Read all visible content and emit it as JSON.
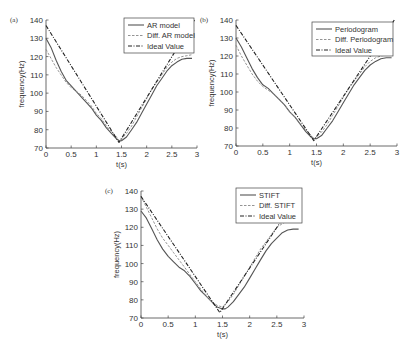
{
  "chart_data": [
    {
      "type": "line",
      "panel_label": "(a)",
      "title": "",
      "xlabel": "t(s)",
      "ylabel": "frequency(Hz)",
      "xlim": [
        0,
        3
      ],
      "ylim": [
        70,
        140
      ],
      "xticks": [
        0,
        0.5,
        1,
        1.5,
        2,
        2.5,
        3
      ],
      "xtick_labels": [
        "0",
        "0.5",
        "1",
        "1.5",
        "2",
        "2.5",
        "3"
      ],
      "yticks": [
        70,
        80,
        90,
        100,
        110,
        120,
        130,
        140
      ],
      "ytick_labels": [
        "70",
        "80",
        "90",
        "100",
        "110",
        "120",
        "130",
        "140"
      ],
      "grid": false,
      "legend_position": "upper right",
      "frame": {
        "x0": 46,
        "x1": 197,
        "y_bottom": 148,
        "y_top": 20
      },
      "legend_box": {
        "x": 124,
        "y": 18,
        "w": 70,
        "h": 35
      },
      "series": [
        {
          "name": "AR model",
          "style": "solid",
          "x": [
            0,
            0.1,
            0.2,
            0.3,
            0.4,
            0.5,
            0.6,
            0.7,
            0.8,
            0.9,
            1.0,
            1.1,
            1.2,
            1.3,
            1.4,
            1.45,
            1.5,
            1.6,
            1.7,
            1.8,
            1.9,
            2.0,
            2.1,
            2.2,
            2.3,
            2.4,
            2.5,
            2.6,
            2.7,
            2.8,
            2.9
          ],
          "y": [
            130,
            125,
            118,
            112,
            107,
            104,
            101,
            98,
            95,
            92,
            88,
            85,
            81,
            78,
            75,
            74,
            74,
            76,
            80,
            84,
            89,
            94,
            99,
            104,
            108,
            112,
            115,
            117,
            118.5,
            119,
            119
          ]
        },
        {
          "name": "Diff. AR model",
          "style": "dashed",
          "x": [
            0,
            0.1,
            0.2,
            0.3,
            0.4,
            0.5,
            0.6,
            0.7,
            0.8,
            0.9,
            1.0,
            1.1,
            1.2,
            1.3,
            1.4,
            1.45,
            1.5,
            1.6,
            1.7,
            1.8,
            1.9,
            2.0,
            2.1,
            2.2,
            2.3,
            2.4,
            2.5,
            2.6,
            2.7,
            2.8,
            2.9
          ],
          "y": [
            124,
            119,
            114,
            110,
            106,
            103,
            101,
            99,
            96,
            93,
            89,
            86,
            82,
            79,
            76,
            74,
            75,
            78,
            82,
            87,
            92,
            97,
            102,
            106,
            110,
            114,
            117,
            119,
            120,
            120.5,
            121
          ]
        },
        {
          "name": "Ideal Value",
          "style": "dashdot",
          "x": [
            0,
            1.45,
            2.95
          ],
          "y": [
            137,
            73,
            140
          ]
        }
      ]
    },
    {
      "type": "line",
      "panel_label": "(b)",
      "title": "",
      "xlabel": "t(s)",
      "ylabel": "frequency(Hz)",
      "xlim": [
        0,
        3
      ],
      "ylim": [
        70,
        140
      ],
      "xticks": [
        0,
        0.5,
        1,
        1.5,
        2,
        2.5,
        3
      ],
      "xtick_labels": [
        "0",
        "0.5",
        "1",
        "1.5",
        "2",
        "2.5",
        "3"
      ],
      "yticks": [
        70,
        80,
        90,
        100,
        110,
        120,
        130,
        140
      ],
      "ytick_labels": [
        "70",
        "80",
        "90",
        "100",
        "110",
        "120",
        "130",
        "140"
      ],
      "grid": false,
      "legend_position": "upper right",
      "frame": {
        "x0": 236,
        "x1": 397,
        "y_bottom": 146,
        "y_top": 20
      },
      "legend_box": {
        "x": 312,
        "y": 22,
        "w": 81,
        "h": 34
      },
      "series": [
        {
          "name": "Periodogram",
          "style": "solid",
          "x": [
            0,
            0.1,
            0.2,
            0.3,
            0.4,
            0.5,
            0.6,
            0.7,
            0.8,
            0.9,
            1.0,
            1.1,
            1.2,
            1.3,
            1.4,
            1.45,
            1.5,
            1.6,
            1.7,
            1.8,
            1.9,
            2.0,
            2.1,
            2.2,
            2.3,
            2.4,
            2.5,
            2.6,
            2.7,
            2.8,
            2.9
          ],
          "y": [
            130,
            125,
            119,
            113,
            108,
            104,
            102,
            99,
            96,
            93,
            89,
            86,
            82,
            78,
            75,
            74,
            74,
            76,
            80,
            84,
            89,
            94,
            99,
            104,
            108,
            112,
            115,
            117,
            118.5,
            119,
            119
          ]
        },
        {
          "name": "Diff. Periodogram",
          "style": "dashed",
          "x": [
            0,
            0.1,
            0.2,
            0.3,
            0.4,
            0.5,
            0.6,
            0.7,
            0.8,
            0.9,
            1.0,
            1.1,
            1.2,
            1.3,
            1.4,
            1.45,
            1.5,
            1.6,
            1.7,
            1.8,
            1.9,
            2.0,
            2.1,
            2.2,
            2.3,
            2.4,
            2.5,
            2.6,
            2.7,
            2.8,
            2.9
          ],
          "y": [
            126,
            120,
            115,
            110,
            106,
            103,
            101,
            99,
            96,
            93,
            89,
            86,
            82,
            79,
            76,
            74,
            75,
            78,
            82,
            87,
            92,
            97,
            102,
            106,
            110,
            114,
            117,
            119,
            120,
            120.5,
            121
          ]
        },
        {
          "name": "Ideal Value",
          "style": "dashdot",
          "x": [
            0,
            1.45,
            2.95
          ],
          "y": [
            137,
            73,
            140
          ]
        }
      ]
    },
    {
      "type": "line",
      "panel_label": "(c)",
      "title": "",
      "xlabel": "t(s)",
      "ylabel": "frequency(Hz)",
      "xlim": [
        0,
        3
      ],
      "ylim": [
        70,
        140
      ],
      "xticks": [
        0,
        0.5,
        1,
        1.5,
        2,
        2.5,
        3
      ],
      "xtick_labels": [
        "0",
        "0.5",
        "1",
        "1.5",
        "2",
        "2.5",
        "3"
      ],
      "yticks": [
        70,
        80,
        90,
        100,
        110,
        120,
        130,
        140
      ],
      "ytick_labels": [
        "70",
        "80",
        "90",
        "100",
        "110",
        "120",
        "130",
        "140"
      ],
      "grid": false,
      "legend_position": "upper right",
      "frame": {
        "x0": 141,
        "x1": 304,
        "y_bottom": 318,
        "y_top": 191
      },
      "legend_box": {
        "x": 236,
        "y": 188,
        "w": 66,
        "h": 35
      },
      "series": [
        {
          "name": "STIFT",
          "style": "solid",
          "x": [
            0,
            0.1,
            0.2,
            0.3,
            0.4,
            0.5,
            0.6,
            0.7,
            0.8,
            0.9,
            1.0,
            1.1,
            1.2,
            1.3,
            1.4,
            1.5,
            1.55,
            1.6,
            1.7,
            1.8,
            1.9,
            2.0,
            2.1,
            2.2,
            2.3,
            2.4,
            2.5,
            2.6,
            2.7,
            2.8,
            2.9
          ],
          "y": [
            129,
            125,
            119,
            113,
            108,
            104,
            101,
            98,
            96,
            93,
            89,
            85,
            82,
            79,
            76,
            75,
            75,
            76,
            79,
            83,
            87,
            92,
            97,
            102,
            107,
            111,
            114,
            117,
            118.5,
            119,
            119
          ]
        },
        {
          "name": "Diff. STIFT",
          "style": "dashed",
          "x": [
            0,
            0.1,
            0.2,
            0.3,
            0.4,
            0.5,
            0.6,
            0.7,
            0.8,
            0.9,
            1.0,
            1.1,
            1.2,
            1.3,
            1.4,
            1.5,
            1.6,
            1.7,
            1.8,
            1.9,
            2.0,
            2.1,
            2.2,
            2.3,
            2.4,
            2.5,
            2.6,
            2.7,
            2.8,
            2.9
          ],
          "y": [
            137,
            131,
            125,
            119,
            114,
            110,
            106,
            102,
            98,
            94,
            90,
            86,
            82,
            79,
            77,
            76,
            79,
            83,
            88,
            93,
            98,
            103,
            108,
            112,
            116,
            120,
            122,
            123.5,
            124,
            124.5
          ]
        },
        {
          "name": "Ideal Value",
          "style": "dashdot",
          "x": [
            0,
            1.45,
            2.95
          ],
          "y": [
            137,
            73,
            140
          ]
        }
      ]
    }
  ]
}
